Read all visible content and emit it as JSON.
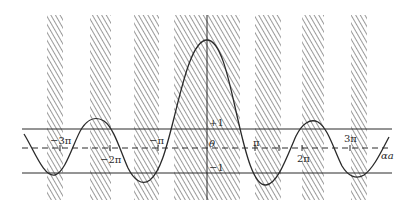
{
  "figure": {
    "type": "function-plot",
    "colors": {
      "ink": "#2a2a2a",
      "hatch": "#555555",
      "background": "#ffffff"
    },
    "lines": {
      "upper": {
        "label": "+1",
        "y": 129
      },
      "center": {
        "label": "θ",
        "y": 148,
        "style": "dashed"
      },
      "lower": {
        "label": "−1",
        "y": 173
      }
    },
    "x_axis_label": "αa",
    "ticks": [
      {
        "label": "−3π",
        "x": 60
      },
      {
        "label": "−2π",
        "x": 110
      },
      {
        "label": "−π",
        "x": 158
      },
      {
        "label": "π",
        "x": 255
      },
      {
        "label": "2π",
        "x": 302
      },
      {
        "label": "3π",
        "x": 350
      }
    ],
    "shaded_bands": [
      {
        "x1": 47,
        "x2": 63
      },
      {
        "x1": 90,
        "x2": 111
      },
      {
        "x1": 134,
        "x2": 159
      },
      {
        "x1": 174,
        "x2": 240
      },
      {
        "x1": 255,
        "x2": 281
      },
      {
        "x1": 302,
        "x2": 324
      },
      {
        "x1": 351,
        "x2": 367
      }
    ]
  },
  "labels": {
    "neg3pi": "−3π",
    "neg2pi": "−2π",
    "negpi": "−π",
    "plus1": "+1",
    "theta": "θ",
    "minus1": "−1",
    "pi": "π",
    "twopi": "2π",
    "threepi": "3π",
    "alpha_a": "αa"
  }
}
